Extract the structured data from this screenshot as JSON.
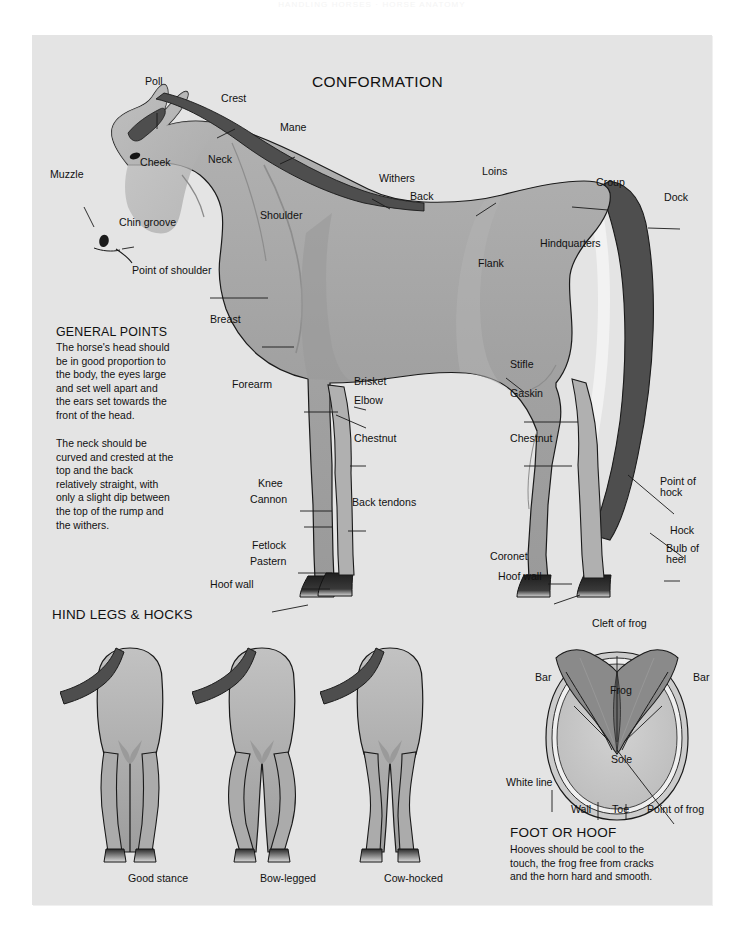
{
  "running_head": "HANDLING HORSES · HORSE ANATOMY",
  "page": {
    "background": "#ffffff",
    "panel_color": "#e4e4e4"
  },
  "palette": {
    "body_mid": "#a0a0a0",
    "body_light": "#b9b9b9",
    "body_pale": "#c6c6c6",
    "body_dark": "#8e8e8e",
    "mane_tail": "#4e4e4e",
    "hoof_dark": "#2e2e2e",
    "outline": "#1a1a1a",
    "frog": "#8a8a8a",
    "sole": "#c9c9c9"
  },
  "sections": {
    "conformation": {
      "title": "CONFORMATION",
      "general_points": {
        "heading": "GENERAL POINTS",
        "paragraph_1": "The horse's head should\nbe in good proportion to\nthe body, the eyes large\nand set well apart and\nthe ears set towards the\nfront of the head.",
        "paragraph_2": "The neck should be\ncurved and crested at the\ntop and the back\nrelatively straight, with\nonly a slight dip between\nthe top of the rump and\nthe withers."
      },
      "labels": [
        {
          "id": "poll",
          "text": "Poll",
          "x": 131,
          "y": 71
        },
        {
          "id": "crest",
          "text": "Crest",
          "x": 207,
          "y": 88
        },
        {
          "id": "mane",
          "text": "Mane",
          "x": 266,
          "y": 117
        },
        {
          "id": "muzzle",
          "text": "Muzzle",
          "x": 36,
          "y": 164
        },
        {
          "id": "cheek",
          "text": "Cheek",
          "x": 126,
          "y": 152
        },
        {
          "id": "neck",
          "text": "Neck",
          "x": 194,
          "y": 149
        },
        {
          "id": "withers",
          "text": "Withers",
          "x": 365,
          "y": 168
        },
        {
          "id": "back",
          "text": "Back",
          "x": 396,
          "y": 186
        },
        {
          "id": "loins",
          "text": "Loins",
          "x": 468,
          "y": 161
        },
        {
          "id": "croup",
          "text": "Croup",
          "x": 582,
          "y": 172
        },
        {
          "id": "dock",
          "text": "Dock",
          "x": 650,
          "y": 187
        },
        {
          "id": "chin-groove",
          "text": "Chin groove",
          "x": 105,
          "y": 212
        },
        {
          "id": "shoulder",
          "text": "Shoulder",
          "x": 246,
          "y": 205
        },
        {
          "id": "hindquarters",
          "text": "Hindquarters",
          "x": 526,
          "y": 233
        },
        {
          "id": "flank",
          "text": "Flank",
          "x": 464,
          "y": 253
        },
        {
          "id": "point-of-shoulder",
          "text": "Point of shoulder",
          "x": 118,
          "y": 260
        },
        {
          "id": "breast",
          "text": "Breast",
          "x": 196,
          "y": 309
        },
        {
          "id": "stifle",
          "text": "Stifle",
          "x": 496,
          "y": 354
        },
        {
          "id": "forearm",
          "text": "Forearm",
          "x": 218,
          "y": 374
        },
        {
          "id": "brisket",
          "text": "Brisket",
          "x": 340,
          "y": 371
        },
        {
          "id": "gaskin",
          "text": "Gaskin",
          "x": 496,
          "y": 383
        },
        {
          "id": "elbow",
          "text": "Elbow",
          "x": 340,
          "y": 390
        },
        {
          "id": "chestnut-front",
          "text": "Chestnut",
          "x": 340,
          "y": 428
        },
        {
          "id": "chestnut-hind",
          "text": "Chestnut",
          "x": 496,
          "y": 428
        },
        {
          "id": "knee",
          "text": "Knee",
          "x": 244,
          "y": 473
        },
        {
          "id": "cannon",
          "text": "Cannon",
          "x": 236,
          "y": 489
        },
        {
          "id": "back-tendons",
          "text": "Back tendons",
          "x": 338,
          "y": 492
        },
        {
          "id": "point-of-hock",
          "text": "Point of\nhock",
          "x": 646,
          "y": 471
        },
        {
          "id": "hock",
          "text": "Hock",
          "x": 656,
          "y": 520
        },
        {
          "id": "fetlock",
          "text": "Fetlock",
          "x": 238,
          "y": 535
        },
        {
          "id": "bulb-of-heel",
          "text": "Bulb of\nheel",
          "x": 652,
          "y": 538
        },
        {
          "id": "pastern",
          "text": "Pastern",
          "x": 236,
          "y": 551
        },
        {
          "id": "coronet",
          "text": "Coronet",
          "x": 476,
          "y": 546
        },
        {
          "id": "hoof-wall-hind",
          "text": "Hoof wall",
          "x": 484,
          "y": 566
        },
        {
          "id": "hoof-wall-front",
          "text": "Hoof wall",
          "x": 196,
          "y": 574
        }
      ]
    },
    "hind_legs": {
      "heading": "HIND LEGS & HOCKS",
      "figures": [
        {
          "id": "good-stance",
          "caption": "Good stance",
          "caption_x": 96,
          "caption_y": 884
        },
        {
          "id": "bow-legged",
          "caption": "Bow-legged",
          "caption_x": 228,
          "caption_y": 884
        },
        {
          "id": "cow-hocked",
          "caption": "Cow-hocked",
          "caption_x": 352,
          "caption_y": 884
        }
      ]
    },
    "foot_or_hoof": {
      "heading": "FOOT OR HOOF",
      "paragraph": "Hooves should be cool to the\ntouch, the frog free from cracks\nand the horn hard and smooth.",
      "labels": [
        {
          "id": "cleft-of-frog",
          "text": "Cleft of frog",
          "x": 578,
          "y": 613
        },
        {
          "id": "bar-left",
          "text": "Bar",
          "x": 521,
          "y": 667
        },
        {
          "id": "bar-right",
          "text": "Bar",
          "x": 679,
          "y": 667
        },
        {
          "id": "frog",
          "text": "Frog",
          "x": 596,
          "y": 680
        },
        {
          "id": "sole",
          "text": "Sole",
          "x": 597,
          "y": 749
        },
        {
          "id": "white-line",
          "text": "White line",
          "x": 492,
          "y": 772
        },
        {
          "id": "wall",
          "text": "Wall",
          "x": 557,
          "y": 799
        },
        {
          "id": "toe",
          "text": "Toe",
          "x": 598,
          "y": 799
        },
        {
          "id": "point-of-frog",
          "text": "Point of frog",
          "x": 633,
          "y": 799
        }
      ]
    }
  }
}
